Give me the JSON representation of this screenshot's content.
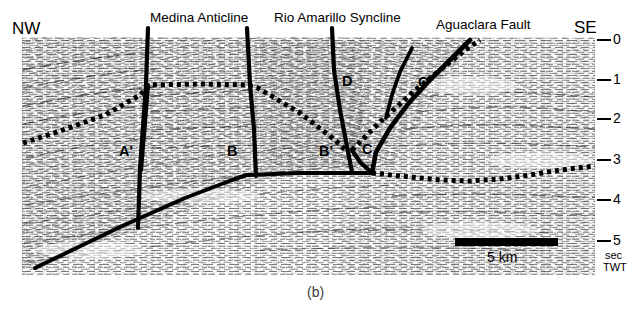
{
  "figure": {
    "caption": "(b)",
    "orientation_left": "NW",
    "orientation_right": "SE"
  },
  "top_annotations": [
    {
      "label": "Medina Anticline",
      "x": 150,
      "y": 12,
      "leaders": [
        148,
        247
      ]
    },
    {
      "label": "Rio Amarillo Syncline",
      "x": 274,
      "y": 12,
      "leaders": [
        332
      ]
    },
    {
      "label": "Aguaclara Fault",
      "x": 436,
      "y": 19,
      "leaders": [
        470
      ]
    }
  ],
  "interior_labels": [
    {
      "label": "A'",
      "x": 119,
      "y": 144
    },
    {
      "label": "B",
      "x": 227,
      "y": 144
    },
    {
      "label": "B'",
      "x": 319,
      "y": 144
    },
    {
      "label": "C",
      "x": 362,
      "y": 142
    },
    {
      "label": "C'",
      "x": 418,
      "y": 75
    },
    {
      "label": "D",
      "x": 342,
      "y": 74
    }
  ],
  "depth_axis": {
    "unit_line1": "sec",
    "unit_line2": "TWT",
    "ticks": [
      {
        "value": "0",
        "y": 40
      },
      {
        "value": "1",
        "y": 80
      },
      {
        "value": "2",
        "y": 119
      },
      {
        "value": "3",
        "y": 160
      },
      {
        "value": "4",
        "y": 200
      },
      {
        "value": "5",
        "y": 241
      }
    ]
  },
  "scale_bar": {
    "label": "5 km",
    "x1": 455,
    "x2": 558,
    "y": 242
  },
  "colors": {
    "ink": "#000000",
    "background": "#ffffff",
    "caption": "#3a3a3a"
  }
}
